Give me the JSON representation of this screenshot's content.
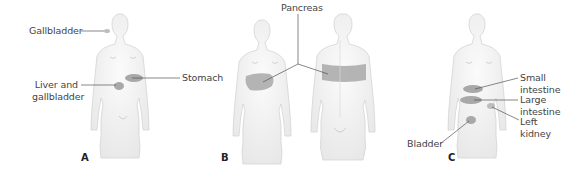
{
  "panels": [
    {
      "letter": "A",
      "view": "front",
      "labels": {
        "gallbladder": "Gallbladder",
        "stomach": "Stomach",
        "liver_line1": "Liver and",
        "liver_line2": "gallbladder"
      }
    },
    {
      "letter": "B",
      "views": [
        "front",
        "back"
      ],
      "labels": {
        "pancreas": "Pancreas"
      }
    },
    {
      "letter": "C",
      "view": "front",
      "labels": {
        "small_line1": "Small",
        "small_line2": "intestine",
        "large_line1": "Large",
        "large_line2": "intestine",
        "kidney_line1": "Left",
        "kidney_line2": "kidney",
        "bladder": "Bladder"
      }
    }
  ],
  "colors": {
    "skin_fill": "#f2f2f2",
    "skin_outline": "#cfcfcf",
    "pain_zone": "#a8a8a8",
    "leader_line": "#555555"
  }
}
